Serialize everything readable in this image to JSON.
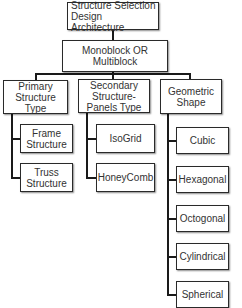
{
  "diagram": {
    "root": {
      "label": "Structure Selection Design Architecture"
    },
    "level1": {
      "label": "Monoblock OR Multiblock"
    },
    "categories": [
      {
        "label": "Primary Structure Type",
        "children": [
          "Frame Structure",
          "Truss Structure"
        ]
      },
      {
        "label": "Secondary Structure-Panels Type",
        "children": [
          "IsoGrid",
          "HoneyComb"
        ]
      },
      {
        "label": "Geometric Shape",
        "children": [
          "Cubic",
          "Hexagonal",
          "Octogonal",
          "Cylindrical",
          "Spherical"
        ]
      }
    ]
  },
  "colors": {
    "line": "#1a1a1a",
    "box_border": "#2a2a2a",
    "text": "#333333",
    "background": "#ffffff"
  }
}
